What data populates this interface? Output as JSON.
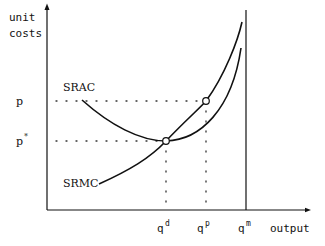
{
  "diagram": {
    "y_axis_label_line1": "unit",
    "y_axis_label_line2": "costs",
    "x_axis_label": "output",
    "price_labels": {
      "p": "p",
      "p_star": "p",
      "p_star_sup": "*"
    },
    "curves": [
      {
        "id": "srac",
        "label": "SRAC"
      },
      {
        "id": "srmc",
        "label": "SRMC"
      }
    ],
    "quantity_labels": [
      {
        "id": "qd",
        "base": "q",
        "sup": "d"
      },
      {
        "id": "qp",
        "base": "q",
        "sup": "p"
      },
      {
        "id": "qm",
        "base": "q",
        "sup": "m"
      }
    ],
    "capacity_line": "q^m vertical capacity limit",
    "intersections": [
      {
        "id": "min-srac",
        "desc": "SRMC crosses SRAC at minimum, price p*, quantity q^d"
      },
      {
        "id": "price-p",
        "desc": "SRMC at price p, quantity q^p"
      }
    ]
  }
}
